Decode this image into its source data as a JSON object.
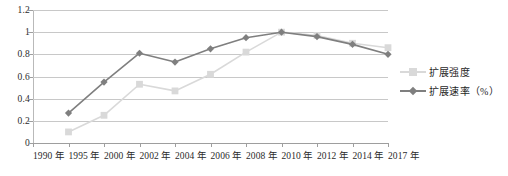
{
  "chart_data": {
    "type": "line",
    "title": "",
    "subtitle": "",
    "xlabel": "",
    "ylabel": "",
    "categories": [
      "1990 年",
      "1995 年",
      "2000 年",
      "2002 年",
      "2004 年",
      "2006 年",
      "2008 年",
      "2010 年",
      "2012 年",
      "2014 年",
      "2017 年"
    ],
    "ylim": [
      0,
      1.2
    ],
    "ytick_labels": [
      "0",
      "0.2",
      "0.4",
      "0.6",
      "0.8",
      "1",
      "1.2"
    ],
    "ytick_values": [
      0,
      0.2,
      0.4,
      0.6,
      0.8,
      1,
      1.2
    ],
    "grid": true,
    "legend_position": "right",
    "series": [
      {
        "name": "扩展强度",
        "color": "#d9d9d9",
        "marker": "square",
        "values": [
          null,
          0.1,
          0.25,
          0.53,
          0.47,
          0.62,
          0.82,
          1.0,
          0.97,
          0.9,
          0.86
        ]
      },
      {
        "name": "扩展速率（%）",
        "color": "#7f7f7f",
        "marker": "diamond",
        "values": [
          null,
          0.27,
          0.55,
          0.81,
          0.73,
          0.85,
          0.95,
          1.0,
          0.96,
          0.89,
          0.8
        ]
      }
    ]
  },
  "legend": {
    "items": [
      {
        "label": "扩展强度"
      },
      {
        "label": "扩展速率（%）"
      }
    ]
  },
  "colors": {
    "series_light": "#d9d9d9",
    "series_dark": "#7f7f7f",
    "gridline": "#c8c8c8",
    "axis": "#9e9e9e",
    "text": "#2b2b2b",
    "background": "#ffffff"
  }
}
